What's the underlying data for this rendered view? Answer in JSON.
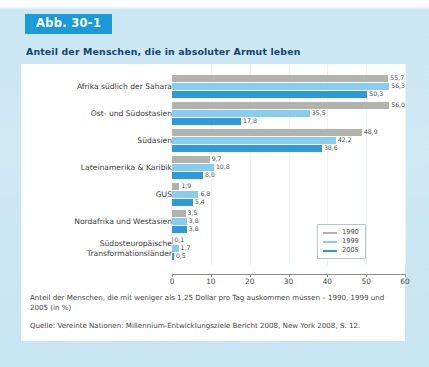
{
  "figure": {
    "badge": "Abb. 30-1",
    "headline": "Anteil der Menschen, die in absoluter Armut leben",
    "caption": "Anteil der Menschen, die mit weniger als 1,25 Dollar pro Tag auskommen müssen – 1990, 1999 und 2005 (in %)",
    "source": "Quelle: Vereinte Nationen: Millennium-Entwicklungsziele Bericht 2008, New York 2008, S. 12."
  },
  "colors": {
    "badge_bg": "#1b9ad6",
    "page_bg": "#cfe9f5",
    "panel_bg": "#ffffff",
    "series_1990": "#b3b3ae",
    "series_1999": "#86cdee",
    "series_2005": "#2e9ad7",
    "headline_text": "#14456b"
  },
  "chart_data": {
    "type": "bar",
    "orientation": "horizontal",
    "title": "Anteil der Menschen, die in absoluter Armut leben",
    "xlabel": "",
    "ylabel": "",
    "xlim": [
      0,
      60
    ],
    "xticks": [
      "0",
      "10",
      "20",
      "30",
      "40",
      "50",
      "60"
    ],
    "grid": false,
    "legend_position": "bottom-right",
    "categories": [
      "Afrika südlich der Sahara",
      "Ost- und Südostasien",
      "Südasien",
      "Lateinamerika & Karibik",
      "GUS",
      "Nordafrika und Westasien",
      "Südosteuropäische\nTransformationsländer"
    ],
    "series": [
      {
        "name": "1990",
        "color": "#b3b3ae",
        "values": [
          55.7,
          56.0,
          48.9,
          9.7,
          1.9,
          3.5,
          0.1
        ],
        "labels": [
          "55,7",
          "56,0",
          "48,9",
          "9,7",
          "1,9",
          "3,5",
          "0,1"
        ]
      },
      {
        "name": "1999",
        "color": "#86cdee",
        "values": [
          56.3,
          35.5,
          42.2,
          10.8,
          6.8,
          3.8,
          1.7
        ],
        "labels": [
          "56,3",
          "35,5",
          "42,2",
          "10,8",
          "6,8",
          "3,8",
          "1,7"
        ]
      },
      {
        "name": "2005",
        "color": "#2e9ad7",
        "values": [
          50.3,
          17.8,
          38.6,
          8.0,
          5.4,
          3.8,
          0.5
        ],
        "labels": [
          "50,3",
          "17,8",
          "38,6",
          "8,0",
          "5,4",
          "3,8",
          "0,5"
        ]
      }
    ]
  }
}
